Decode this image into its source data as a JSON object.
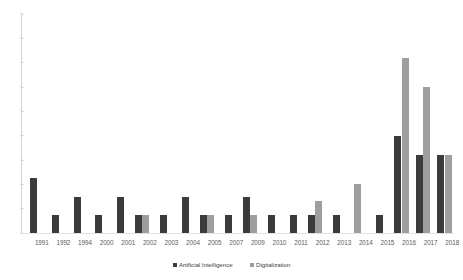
{
  "chart_data": {
    "type": "bar",
    "title": "",
    "subtitle": "",
    "xlabel": "",
    "ylabel": "",
    "grid": false,
    "legend_position": "bottom",
    "categories": [
      "1991",
      "1992",
      "1994",
      "2000",
      "2001",
      "2002",
      "2003",
      "2004",
      "2005",
      "2007",
      "2009",
      "2010",
      "2011",
      "2012",
      "2013",
      "2014",
      "2015",
      "2016",
      "2017",
      "2018"
    ],
    "ylim": [
      0,
      9
    ],
    "yticks": [
      0,
      1,
      2,
      3,
      4,
      5,
      6,
      7,
      8,
      9
    ],
    "ytick_labels": [
      "0",
      "1",
      "2",
      "3",
      "4",
      "5",
      "6",
      "7",
      "8",
      "9"
    ],
    "series": [
      {
        "name": "Artificial Intelligence",
        "color": "#3b3b3b",
        "values": [
          2.25,
          0.75,
          1.5,
          0.75,
          1.5,
          0.75,
          0.75,
          1.5,
          0.75,
          0.75,
          1.5,
          0.75,
          0.75,
          0.75,
          0.75,
          0,
          0.75,
          4.0,
          3.2,
          3.2
        ]
      },
      {
        "name": "Digitalization",
        "color": "#9e9e9e",
        "values": [
          0,
          0,
          0,
          0,
          0,
          0.75,
          0,
          0,
          0.75,
          0,
          0.75,
          0,
          0,
          1.3,
          0,
          2.0,
          0,
          7.2,
          6.0,
          3.2
        ]
      }
    ]
  },
  "legend": {
    "items": [
      {
        "label": "Artificial Intelligence",
        "color": "#3b3b3b"
      },
      {
        "label": "Digitalization",
        "color": "#9e9e9e"
      }
    ]
  }
}
